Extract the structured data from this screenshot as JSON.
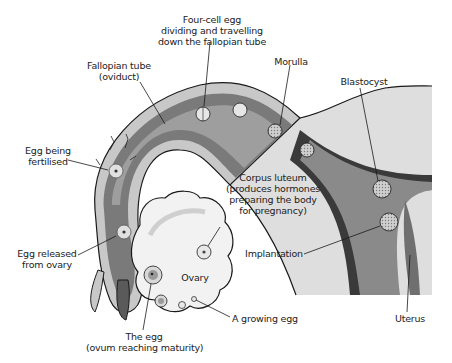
{
  "colors": {
    "outer_wall": "#c8c8c8",
    "inner_lining": "#7a7a7a",
    "lumen_light": "#a8a8a8",
    "uterus_light": "#dedede",
    "uterus_dark_lining": "#3a3a3a",
    "ovary_fill": "#f2f2f2",
    "outline": "#1a1a1a",
    "text": "#222222"
  },
  "labels": {
    "four_cell": [
      "Four-cell egg",
      "dividing and travelling",
      "down the fallopian tube"
    ],
    "fallopian": [
      "Fallopian tube",
      "(oviduct)"
    ],
    "morulla": [
      "Morulla"
    ],
    "blastocyst": [
      "Blastocyst"
    ],
    "egg_fertilised": [
      "Egg being",
      "fertilised"
    ],
    "corpus_luteum": [
      "Corpus luteum",
      "(produces hormones",
      "preparing the body",
      "for pregnancy)"
    ],
    "egg_released": [
      "Egg released",
      "from ovary"
    ],
    "ovary": [
      "Ovary"
    ],
    "implantation": [
      "Implantation"
    ],
    "the_egg": [
      "The egg",
      "(ovum reaching maturity)"
    ],
    "growing_egg": [
      "A growing egg"
    ],
    "uterus": [
      "Uterus"
    ]
  }
}
